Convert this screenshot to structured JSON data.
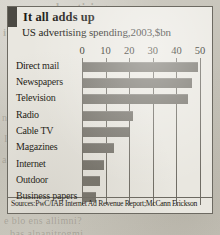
{
  "card": {
    "title": "It all adds up",
    "subtitle": "US advertising spending,2003,$bn",
    "source": "Sources:PwC/IAB Internet Ad Revenue Report;McCann Erickson"
  },
  "colors": {
    "bar": "#76736b",
    "accent_tab": "#4c4a44",
    "card_background": "#e9e7e0",
    "frame": "#6d6a62",
    "page_background": "#c9c6bd"
  },
  "background_bleed": [
    "advertising spen",
    "ing ditnesitievbs",
    "noug",
    "Ivertising agencies",
    "a aril ris animora Y",
    "e blo ens allimni?",
    "bas alnanitrogmi"
  ],
  "chart_data": {
    "type": "bar",
    "orientation": "horizontal",
    "title": "It all adds up",
    "subtitle": "US advertising spending,2003,$bn",
    "xlabel": "",
    "ylabel": "",
    "xlim": [
      0,
      50
    ],
    "xticks": [
      0,
      10,
      20,
      30,
      40,
      50
    ],
    "xtick_labels": [
      "0",
      "10",
      "20",
      "30",
      "40",
      "50"
    ],
    "grid": true,
    "legend": false,
    "units": "$bn",
    "year": 2003,
    "categories": [
      "Direct mail",
      "Newspapers",
      "Television",
      "Radio",
      "Cable TV",
      "Magazines",
      "Internet",
      "Outdoor",
      "Business papers"
    ],
    "values": [
      48.7,
      46.2,
      44.5,
      21.0,
      19.6,
      13.0,
      9.0,
      7.0,
      5.5
    ],
    "source": "Sources:PwC/IAB Internet Ad Revenue Report;McCann Erickson"
  }
}
